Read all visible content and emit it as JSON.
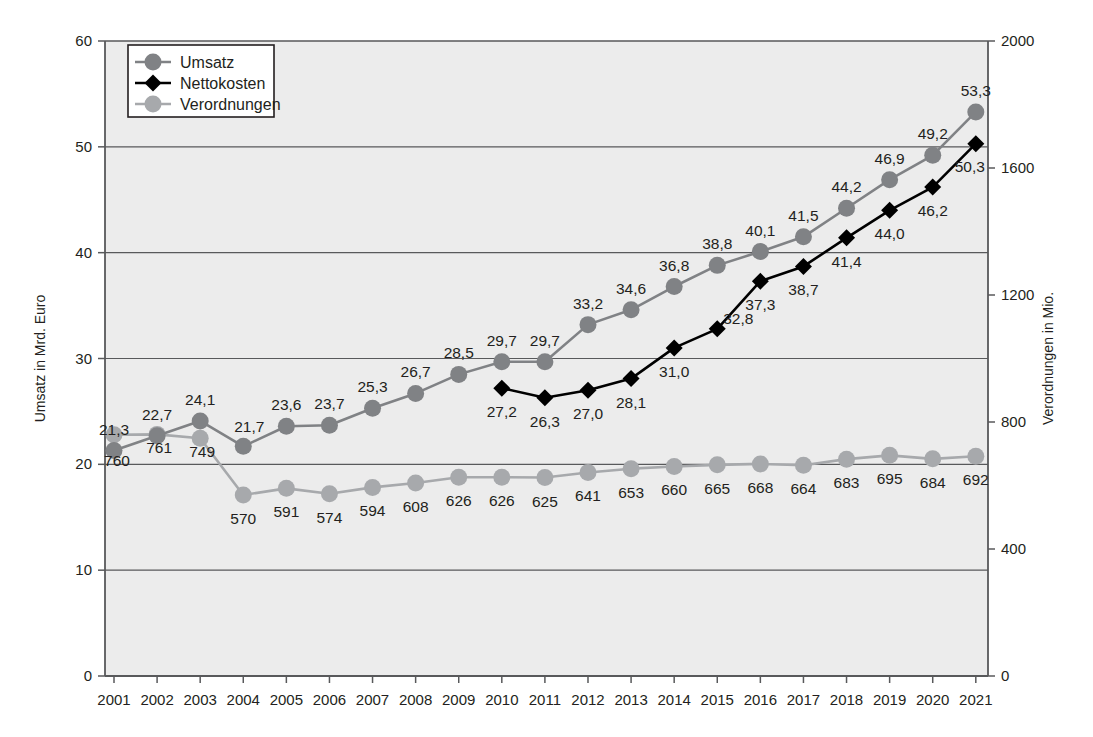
{
  "chart_data": {
    "type": "line",
    "title": "",
    "xlabel": "",
    "ylabel": "Umsatz in Mrd. Euro",
    "y2label": "Verordnungen in Mio.",
    "grid": true,
    "legend_position": "top-left",
    "ylim": [
      0,
      60
    ],
    "yticks": [
      "0",
      "10",
      "20",
      "30",
      "40",
      "50",
      "60"
    ],
    "y2lim": [
      0,
      2000
    ],
    "y2ticks": [
      "0",
      "400",
      "800",
      "1200",
      "1600",
      "2000"
    ],
    "categories": [
      "2001",
      "2002",
      "2003",
      "2004",
      "2005",
      "2006",
      "2007",
      "2008",
      "2009",
      "2010",
      "2011",
      "2012",
      "2013",
      "2014",
      "2015",
      "2016",
      "2017",
      "2018",
      "2019",
      "2020",
      "2021"
    ],
    "series": [
      {
        "name": "Umsatz",
        "axis": "left",
        "color": "#808285",
        "marker": "circle",
        "values": [
          21.3,
          22.7,
          24.1,
          21.7,
          23.6,
          23.7,
          25.3,
          26.7,
          28.5,
          29.7,
          29.7,
          33.2,
          34.6,
          36.8,
          38.8,
          40.1,
          41.5,
          44.2,
          46.9,
          49.2,
          53.3
        ],
        "labels": [
          "21,3",
          "22,7",
          "24,1",
          "21,7",
          "23,6",
          "23,7",
          "25,3",
          "26,7",
          "28,5",
          "29,7",
          "29,7",
          "33,2",
          "34,6",
          "36,8",
          "38,8",
          "40,1",
          "41,5",
          "44,2",
          "46,9",
          "49,2",
          "53,3"
        ],
        "label_pos": [
          "above",
          "above",
          "above",
          "above",
          "above",
          "above",
          "above",
          "above",
          "above",
          "above",
          "above",
          "above",
          "above",
          "above",
          "above",
          "above",
          "above",
          "above",
          "above",
          "above",
          "above"
        ]
      },
      {
        "name": "Nettokosten",
        "axis": "left",
        "color": "#000000",
        "marker": "diamond",
        "values": [
          null,
          null,
          null,
          null,
          null,
          null,
          null,
          null,
          null,
          27.2,
          26.3,
          27.0,
          28.1,
          31.0,
          32.8,
          37.3,
          38.7,
          41.4,
          44.0,
          46.2,
          50.3
        ],
        "labels": [
          "",
          "",
          "",
          "",
          "",
          "",
          "",
          "",
          "",
          "27,2",
          "26,3",
          "27,0",
          "28,1",
          "31,0",
          "32,8",
          "37,3",
          "38,7",
          "41,4",
          "44,0",
          "46,2",
          "50,3"
        ],
        "label_pos": [
          "",
          "",
          "",
          "",
          "",
          "",
          "",
          "",
          "",
          "below",
          "below",
          "below",
          "below",
          "below",
          "above",
          "below",
          "below",
          "below",
          "below",
          "below",
          "above"
        ]
      },
      {
        "name": "Verordnungen",
        "axis": "right",
        "color": "#a7a9ac",
        "marker": "circle",
        "values": [
          760,
          761,
          749,
          570,
          591,
          574,
          594,
          608,
          626,
          626,
          625,
          641,
          653,
          660,
          665,
          668,
          664,
          683,
          695,
          684,
          692
        ],
        "labels": [
          "760",
          "761",
          "749",
          "570",
          "591",
          "574",
          "594",
          "608",
          "626",
          "626",
          "625",
          "641",
          "653",
          "660",
          "665",
          "668",
          "664",
          "683",
          "695",
          "684",
          "692"
        ],
        "label_pos": [
          "below",
          "below",
          "below",
          "below",
          "below",
          "below",
          "below",
          "below",
          "below",
          "below",
          "below",
          "below",
          "below",
          "below",
          "below",
          "below",
          "below",
          "below",
          "below",
          "below",
          "below"
        ]
      }
    ]
  },
  "legend": {
    "items": [
      {
        "label": "Umsatz",
        "color": "#808285",
        "marker": "circle"
      },
      {
        "label": "Nettokosten",
        "color": "#000000",
        "marker": "diamond"
      },
      {
        "label": "Verordnungen",
        "color": "#a7a9ac",
        "marker": "circle"
      }
    ]
  },
  "style": {
    "plot_background": "#ececec",
    "axis_color": "#58595b",
    "grid_color": "#58595b",
    "text_color": "#231f20"
  }
}
